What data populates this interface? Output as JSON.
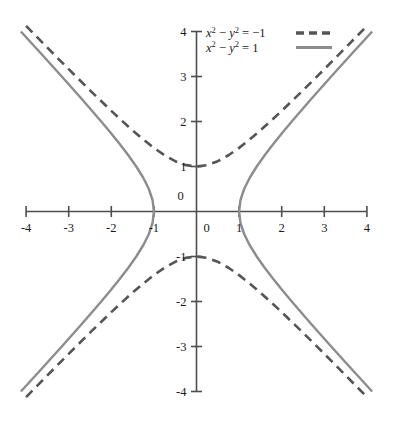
{
  "chart_data": {
    "type": "line",
    "title": "",
    "xlabel": "",
    "ylabel": "",
    "xlim": [
      -4,
      4
    ],
    "ylim": [
      -4,
      4
    ],
    "grid": false,
    "legend_position": "top-center-right",
    "x_ticks": [
      "-4",
      "-3",
      "-2",
      "-1",
      "0",
      "1",
      "2",
      "3",
      "4"
    ],
    "x_tick_values": [
      -4,
      -3,
      -2,
      -1,
      0,
      1,
      2,
      3,
      4
    ],
    "y_ticks": [
      "4",
      "3",
      "2",
      "1",
      "0",
      "-1",
      "-2",
      "-3",
      "-4"
    ],
    "y_tick_values": [
      4,
      3,
      2,
      1,
      0,
      -1,
      -2,
      -3,
      -4
    ],
    "origin_label_x": "0",
    "origin_label_y": "0",
    "series": [
      {
        "name": "x^2 - y^2 = -1",
        "label_lhs_var1": "x",
        "label_exp1": "2",
        "label_minus": "−",
        "label_lhs_var2": "y",
        "label_exp2": "2",
        "label_equals": "=",
        "label_rhs": "−1",
        "style": "dashed",
        "color": "#555555",
        "width": 2.6,
        "dash": "9,6",
        "equation": "x^2 - y^2 = -1",
        "vertices": [
          [
            0,
            1
          ],
          [
            0,
            -1
          ]
        ],
        "asymptotes": [
          "y = x",
          "y = -x"
        ],
        "branches": [
          {
            "name": "upper",
            "points": [
              [
                -4,
                4.1231
              ],
              [
                -3.5,
                3.6401
              ],
              [
                -3,
                3.1623
              ],
              [
                -2.5,
                2.6926
              ],
              [
                -2,
                2.2361
              ],
              [
                -1.75,
                2.0156
              ],
              [
                -1.5,
                1.8028
              ],
              [
                -1.25,
                1.6008
              ],
              [
                -1,
                1.4142
              ],
              [
                -0.75,
                1.25
              ],
              [
                -0.5,
                1.118
              ],
              [
                -0.25,
                1.0308
              ],
              [
                0,
                1
              ],
              [
                0.25,
                1.0308
              ],
              [
                0.5,
                1.118
              ],
              [
                0.75,
                1.25
              ],
              [
                1,
                1.4142
              ],
              [
                1.25,
                1.6008
              ],
              [
                1.5,
                1.8028
              ],
              [
                1.75,
                2.0156
              ],
              [
                2,
                2.2361
              ],
              [
                2.5,
                2.6926
              ],
              [
                3,
                3.1623
              ],
              [
                3.5,
                3.6401
              ],
              [
                4,
                4.1231
              ]
            ]
          },
          {
            "name": "lower",
            "points": [
              [
                -4,
                -4.1231
              ],
              [
                -3.5,
                -3.6401
              ],
              [
                -3,
                -3.1623
              ],
              [
                -2.5,
                -2.6926
              ],
              [
                -2,
                -2.2361
              ],
              [
                -1.75,
                -2.0156
              ],
              [
                -1.5,
                -1.8028
              ],
              [
                -1.25,
                -1.6008
              ],
              [
                -1,
                -1.4142
              ],
              [
                -0.75,
                -1.25
              ],
              [
                -0.5,
                -1.118
              ],
              [
                -0.25,
                -1.0308
              ],
              [
                0,
                -1
              ],
              [
                0.25,
                -1.0308
              ],
              [
                0.5,
                -1.118
              ],
              [
                0.75,
                -1.25
              ],
              [
                1,
                -1.4142
              ],
              [
                1.25,
                -1.6008
              ],
              [
                1.5,
                -1.8028
              ],
              [
                1.75,
                -2.0156
              ],
              [
                2,
                -2.2361
              ],
              [
                2.5,
                -2.6926
              ],
              [
                3,
                -3.1623
              ],
              [
                3.5,
                -3.6401
              ],
              [
                4,
                -4.1231
              ]
            ]
          }
        ]
      },
      {
        "name": "x^2 - y^2 = 1",
        "label_lhs_var1": "x",
        "label_exp1": "2",
        "label_minus": "−",
        "label_lhs_var2": "y",
        "label_exp2": "2",
        "label_equals": "=",
        "label_rhs": "1",
        "style": "solid",
        "color": "#8c8c8c",
        "width": 2.4,
        "dash": "",
        "equation": "x^2 - y^2 = 1",
        "vertices": [
          [
            1,
            0
          ],
          [
            -1,
            0
          ]
        ],
        "asymptotes": [
          "y = x",
          "y = -x"
        ],
        "branches": [
          {
            "name": "right",
            "points": [
              [
                4.1231,
                4
              ],
              [
                3.6401,
                3.5
              ],
              [
                3.1623,
                3
              ],
              [
                2.6926,
                2.5
              ],
              [
                2.2361,
                2
              ],
              [
                2.0156,
                1.75
              ],
              [
                1.8028,
                1.5
              ],
              [
                1.6008,
                1.25
              ],
              [
                1.4142,
                1
              ],
              [
                1.25,
                0.75
              ],
              [
                1.118,
                0.5
              ],
              [
                1.0308,
                0.25
              ],
              [
                1,
                0
              ],
              [
                1.0308,
                -0.25
              ],
              [
                1.118,
                -0.5
              ],
              [
                1.25,
                -0.75
              ],
              [
                1.4142,
                -1
              ],
              [
                1.6008,
                -1.25
              ],
              [
                1.8028,
                -1.5
              ],
              [
                2.0156,
                -1.75
              ],
              [
                2.2361,
                -2
              ],
              [
                2.6926,
                -2.5
              ],
              [
                3.1623,
                -3
              ],
              [
                3.6401,
                -3.5
              ],
              [
                4.1231,
                -4
              ]
            ]
          },
          {
            "name": "left",
            "points": [
              [
                -4.1231,
                4
              ],
              [
                -3.6401,
                3.5
              ],
              [
                -3.1623,
                3
              ],
              [
                -2.6926,
                2.5
              ],
              [
                -2.2361,
                2
              ],
              [
                -2.0156,
                1.75
              ],
              [
                -1.8028,
                1.5
              ],
              [
                -1.6008,
                1.25
              ],
              [
                -1.4142,
                1
              ],
              [
                -1.25,
                0.75
              ],
              [
                -1.118,
                0.5
              ],
              [
                -1.0308,
                0.25
              ],
              [
                -1,
                0
              ],
              [
                -1.0308,
                -0.25
              ],
              [
                -1.118,
                -0.5
              ],
              [
                -1.25,
                -0.75
              ],
              [
                -1.4142,
                -1
              ],
              [
                -1.6008,
                -1.25
              ],
              [
                -1.8028,
                -1.5
              ],
              [
                -2.0156,
                -1.75
              ],
              [
                -2.2361,
                -2
              ],
              [
                -2.6926,
                -2.5
              ],
              [
                -3.1623,
                -3
              ],
              [
                -3.6401,
                -3.5
              ],
              [
                -4.1231,
                -4
              ]
            ]
          }
        ]
      }
    ],
    "axis_color": "#4d4d4d",
    "background": "#ffffff"
  }
}
